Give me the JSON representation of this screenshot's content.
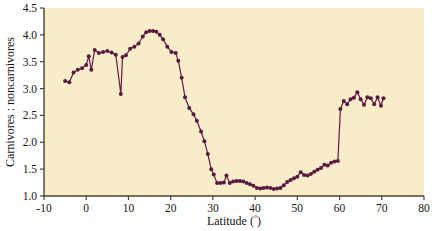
{
  "chart_data": {
    "type": "line",
    "title": "",
    "subtitle": "",
    "xlabel": "Latitude (°)",
    "ylabel": "Carnivores : noncarnivores",
    "xlim": [
      -10,
      80
    ],
    "ylim": [
      1.0,
      4.5
    ],
    "xticks": [
      -10,
      0,
      10,
      20,
      30,
      40,
      50,
      60,
      70,
      80
    ],
    "xtick_labels": [
      "-10",
      "0",
      "10",
      "20",
      "30",
      "40",
      "50",
      "60",
      "70",
      "80"
    ],
    "yticks": [
      1.0,
      1.5,
      2.0,
      2.5,
      3.0,
      3.5,
      4.0,
      4.5
    ],
    "ytick_labels": [
      "1.0",
      "1.5",
      "2.0",
      "2.5",
      "3.0",
      "3.5",
      "4.0",
      "4.5"
    ],
    "grid": false,
    "legend": null,
    "markers": "filled-circle",
    "series": [
      {
        "name": "Carnivores : noncarnivores ratio by latitude",
        "color": "#6b1f4e",
        "marker_color": "#5a1840",
        "x": [
          -5.0,
          -4.0,
          -3.0,
          -2.0,
          -1.0,
          0.0,
          0.6,
          1.2,
          2.0,
          3.0,
          4.0,
          5.0,
          6.0,
          7.0,
          8.2,
          8.6,
          9.4,
          10.4,
          11.4,
          12.4,
          13.4,
          14.2,
          15.0,
          15.8,
          16.6,
          17.4,
          18.2,
          19.2,
          20.2,
          21.2,
          21.8,
          22.6,
          23.4,
          24.4,
          25.4,
          26.2,
          27.2,
          28.0,
          28.8,
          29.6,
          30.2,
          31.0,
          31.8,
          32.6,
          33.2,
          34.0,
          34.8,
          35.6,
          36.4,
          37.2,
          38.0,
          38.8,
          39.6,
          40.4,
          41.2,
          42.0,
          42.8,
          43.6,
          44.4,
          45.2,
          46.0,
          46.8,
          47.6,
          48.4,
          49.2,
          50.0,
          50.8,
          51.6,
          52.4,
          53.2,
          54.0,
          54.8,
          55.6,
          56.4,
          57.2,
          58.0,
          58.8,
          59.6,
          60.2,
          61.0,
          61.8,
          62.6,
          63.4,
          64.2,
          65.0,
          65.8,
          66.6,
          67.4,
          68.2,
          69.0,
          69.8,
          70.4
        ],
        "y": [
          3.14,
          3.12,
          3.3,
          3.35,
          3.38,
          3.44,
          3.6,
          3.35,
          3.72,
          3.66,
          3.68,
          3.7,
          3.67,
          3.63,
          2.9,
          3.59,
          3.62,
          3.74,
          3.78,
          3.84,
          3.97,
          4.05,
          4.07,
          4.07,
          4.06,
          4.0,
          3.92,
          3.78,
          3.68,
          3.66,
          3.52,
          3.2,
          2.84,
          2.64,
          2.52,
          2.4,
          2.2,
          2.02,
          1.78,
          1.5,
          1.4,
          1.24,
          1.24,
          1.25,
          1.38,
          1.24,
          1.27,
          1.28,
          1.28,
          1.27,
          1.24,
          1.22,
          1.19,
          1.15,
          1.14,
          1.15,
          1.16,
          1.15,
          1.13,
          1.14,
          1.15,
          1.2,
          1.26,
          1.3,
          1.33,
          1.36,
          1.44,
          1.39,
          1.38,
          1.41,
          1.45,
          1.49,
          1.52,
          1.58,
          1.57,
          1.62,
          1.64,
          1.65,
          2.62,
          2.77,
          2.71,
          2.8,
          2.83,
          2.93,
          2.8,
          2.7,
          2.84,
          2.82,
          2.71,
          2.84,
          2.68,
          2.82
        ]
      }
    ],
    "colors": {
      "plot_background": "#f7eec9",
      "line": "#6b1f4e",
      "marker": "#551739",
      "axis": "#4a4336",
      "text": "#141414",
      "figure_background": "#ffffff"
    }
  }
}
